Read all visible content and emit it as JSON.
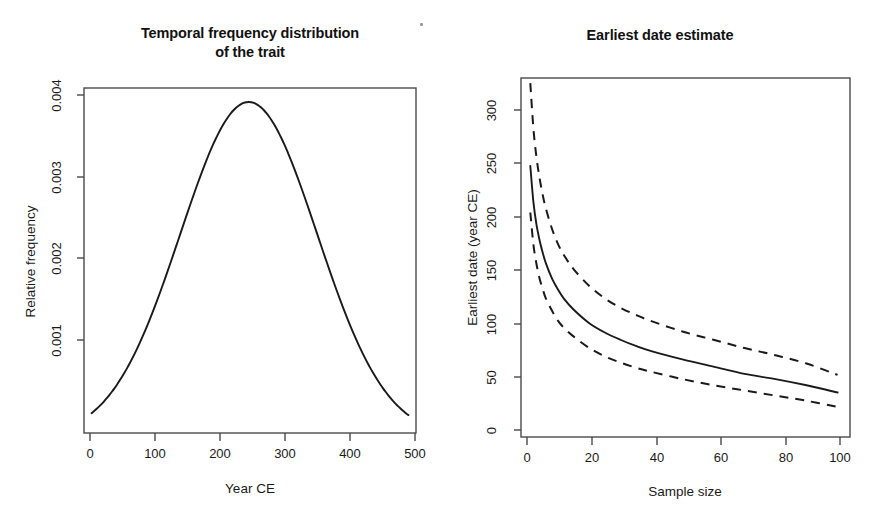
{
  "figure": {
    "background": "#ffffff",
    "line_color": "#1a1a1a",
    "axis_color": "#4a4a4a",
    "speck_artifact": "scan-speck"
  },
  "panels": [
    {
      "id": "left",
      "title": "Temporal frequency distribution\nof the trait",
      "xlabel": "Year CE",
      "ylabel": "Relative frequency"
    },
    {
      "id": "right",
      "title": "Earliest date estimate",
      "xlabel": "Sample size",
      "ylabel": "Earliest date (year CE)"
    }
  ],
  "chart_data": [
    {
      "type": "line",
      "panel": "left",
      "title": "Temporal frequency distribution of the trait",
      "xlabel": "Year CE",
      "ylabel": "Relative frequency",
      "xlim": [
        -12,
        512
      ],
      "ylim": [
        5e-05,
        0.00422
      ],
      "xticks": [
        0,
        100,
        200,
        300,
        400,
        500
      ],
      "xtick_labels": [
        "0",
        "100",
        "200",
        "300",
        "400",
        "500"
      ],
      "yticks": [
        0.001,
        0.002,
        0.003,
        0.004
      ],
      "ytick_labels": [
        "0.001",
        "0.002",
        "0.003",
        "0.004"
      ],
      "grid": false,
      "legend": null,
      "distribution": {
        "shape": "gaussian",
        "mean": 248,
        "sd": 108,
        "peak_value": 0.00405
      },
      "x": [
        0,
        25,
        50,
        75,
        100,
        125,
        150,
        175,
        200,
        225,
        250,
        275,
        300,
        325,
        350,
        375,
        400,
        425,
        450,
        475,
        500
      ],
      "values": [
        0.00016,
        0.00028,
        0.00047,
        0.00074,
        0.00109,
        0.00152,
        0.00199,
        0.00248,
        0.00297,
        0.00351,
        0.00405,
        0.004,
        0.00367,
        0.00318,
        0.00264,
        0.00211,
        0.00162,
        0.0012,
        0.00085,
        0.00058,
        0.00022
      ]
    },
    {
      "type": "line",
      "panel": "right",
      "title": "Earliest date estimate",
      "xlabel": "Sample size",
      "ylabel": "Earliest date (year CE)",
      "xlim": [
        -2,
        104
      ],
      "ylim": [
        -12,
        335
      ],
      "xticks": [
        0,
        20,
        40,
        60,
        80,
        100
      ],
      "xtick_labels": [
        "0",
        "20",
        "40",
        "60",
        "80",
        "100"
      ],
      "yticks": [
        0,
        50,
        100,
        150,
        200,
        250,
        300
      ],
      "ytick_labels": [
        "0",
        "50",
        "100",
        "150",
        "200",
        "250",
        "300"
      ],
      "grid": false,
      "legend": null,
      "x": [
        1,
        2,
        3,
        4,
        5,
        6,
        8,
        10,
        12,
        15,
        20,
        25,
        30,
        35,
        40,
        50,
        60,
        70,
        80,
        90,
        100
      ],
      "series": [
        {
          "name": "upper confidence bound",
          "style": "dashed",
          "values": [
            330,
            286,
            258,
            238,
            222,
            209,
            189,
            174,
            163,
            150,
            134,
            122,
            113,
            106,
            100,
            90,
            82,
            74,
            67,
            59,
            48
          ]
        },
        {
          "name": "median estimate",
          "style": "solid",
          "values": [
            250,
            215,
            193,
            178,
            166,
            156,
            141,
            130,
            121,
            111,
            98,
            89,
            82,
            76,
            71,
            63,
            56,
            49,
            44,
            38,
            31
          ]
        },
        {
          "name": "lower confidence bound",
          "style": "dashed",
          "values": [
            205,
            174,
            155,
            141,
            131,
            122,
            110,
            100,
            93,
            85,
            74,
            66,
            60,
            55,
            51,
            44,
            38,
            33,
            28,
            23,
            17
          ]
        }
      ]
    }
  ]
}
